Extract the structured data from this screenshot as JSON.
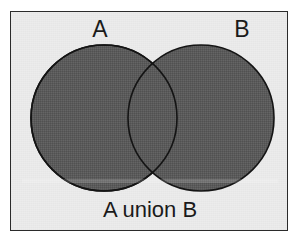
{
  "figure": {
    "kind": "venn-diagram",
    "caption": "A union B",
    "labels": {
      "set_a": "A",
      "set_b": "B"
    },
    "colors": {
      "page_background": "#ffffff",
      "panel_background": "#ececec",
      "frame_border": "#2b2b2b",
      "circle_fill": "#5a5a5a",
      "circle_outline": "#141414",
      "text": "#1a1a1a"
    },
    "geometry": {
      "frame": {
        "x": 10,
        "y": 11,
        "width": 278,
        "height": 220
      },
      "circle_a": {
        "cx": 93,
        "cy": 106,
        "r": 73
      },
      "circle_b": {
        "cx": 190,
        "cy": 106,
        "r": 73
      }
    },
    "shading": {
      "region_a_only": "shaded",
      "region_b_only": "shaded",
      "region_intersection": "shaded",
      "region_outside": "unshaded",
      "description": "A union B"
    }
  }
}
